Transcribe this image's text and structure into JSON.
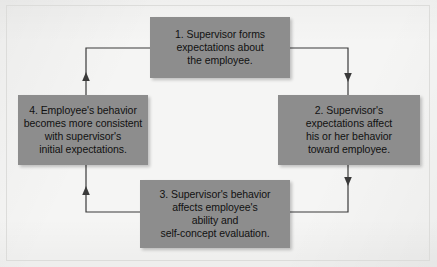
{
  "diagram": {
    "type": "cyclical-flow",
    "direction": "clockwise",
    "colors": {
      "background": "#f5f5f4",
      "box_fill": "#8d8d8d",
      "box_text": "#111111",
      "connector": "#3a3a3a",
      "frame_border": "#dcdcda"
    },
    "nodes": [
      {
        "id": "node-1",
        "number": "1.",
        "position": "top-center",
        "lines": [
          "1. Supervisor forms",
          "expectations about",
          "the employee."
        ]
      },
      {
        "id": "node-2",
        "number": "2.",
        "position": "right",
        "lines": [
          "2. Supervisor's",
          "expectations affect",
          "his or her behavior",
          "toward employee."
        ]
      },
      {
        "id": "node-3",
        "number": "3.",
        "position": "bottom-center",
        "lines": [
          "3. Supervisor's behavior",
          "affects employee's",
          "ability and",
          "self-concept evaluation."
        ]
      },
      {
        "id": "node-4",
        "number": "4.",
        "position": "left",
        "lines": [
          "4. Employee's behavior",
          "becomes more consistent",
          "with supervisor's",
          "initial expectations."
        ]
      }
    ],
    "connectors": [
      {
        "id": "connector-1-to-2",
        "from": "node-1",
        "to": "node-2",
        "arrowhead": "down"
      },
      {
        "id": "connector-2-to-3",
        "from": "node-2",
        "to": "node-3",
        "arrowhead": "down"
      },
      {
        "id": "connector-3-to-4",
        "from": "node-3",
        "to": "node-4",
        "arrowhead": "up"
      },
      {
        "id": "connector-4-to-1",
        "from": "node-4",
        "to": "node-1",
        "arrowhead": "up"
      }
    ]
  }
}
